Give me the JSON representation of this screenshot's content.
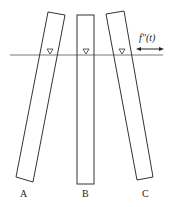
{
  "diagram": {
    "bars": [
      {
        "label": "A",
        "tilt": "leaning-right"
      },
      {
        "label": "B",
        "tilt": "vertical"
      },
      {
        "label": "C",
        "tilt": "leaning-left"
      }
    ],
    "water_line": {
      "marker": "inverted-triangle"
    },
    "force_label": "f″(t)",
    "arrow": "double-headed-horizontal",
    "colors": {
      "stroke": "#333333",
      "background": "#ffffff"
    }
  }
}
